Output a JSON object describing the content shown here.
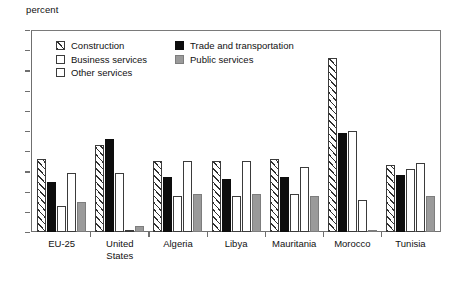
{
  "chart_data": {
    "type": "bar",
    "title": "",
    "subtitle": "",
    "xlabel": "",
    "ylabel": "percent",
    "ylim": [
      0,
      100
    ],
    "ytick_step": 10,
    "yticks": [
      100,
      90,
      80,
      70,
      60,
      50,
      40,
      30,
      20,
      10,
      0
    ],
    "grid": false,
    "legend_position": "inside-top-left",
    "categories": [
      "EU-25",
      "United\nStates",
      "Algeria",
      "Libya",
      "Mauritania",
      "Morocco",
      "Tunisia"
    ],
    "series": [
      {
        "name": "Construction",
        "pattern": "diagonal-hatch",
        "color": "#ffffff",
        "values": [
          36,
          43,
          35,
          35,
          36,
          86,
          33
        ]
      },
      {
        "name": "Trade and transportation",
        "pattern": "solid-black",
        "color": "#0d0d0d",
        "values": [
          25,
          46,
          27,
          26,
          27,
          49,
          28
        ]
      },
      {
        "name": "Business services",
        "pattern": "white-outline",
        "color": "#ffffff",
        "values": [
          13,
          29,
          18,
          18,
          19,
          50,
          31
        ]
      },
      {
        "name": "Other services",
        "pattern": "dotted",
        "color": "#ffffff",
        "values": [
          29,
          1,
          35,
          35,
          32,
          16,
          34
        ]
      },
      {
        "name": "Public services",
        "pattern": "gray",
        "color": "#9a9a9a",
        "values": [
          15,
          3,
          19,
          19,
          18,
          1,
          18
        ]
      }
    ],
    "legend_order_left": [
      "Construction",
      "Business services",
      "Other services"
    ],
    "legend_order_right": [
      "Trade and transportation",
      "Public services"
    ],
    "bar_draw_order": [
      "Construction",
      "Trade and transportation",
      "Business services",
      "Other services",
      "Public services"
    ]
  }
}
